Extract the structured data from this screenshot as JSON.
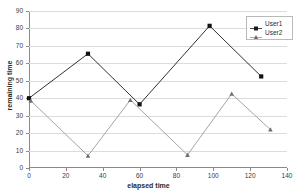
{
  "chart_data": {
    "type": "line",
    "title": "",
    "xlabel": "elapsed time",
    "ylabel": "remaining time",
    "xlim": [
      0,
      140
    ],
    "ylim": [
      0,
      90
    ],
    "xticks": [
      0,
      20,
      40,
      60,
      80,
      100,
      120,
      140
    ],
    "yticks": [
      0,
      10,
      20,
      30,
      40,
      50,
      60,
      70,
      80,
      90
    ],
    "grid": "horizontal",
    "legend_position": "top-right",
    "series": [
      {
        "name": "User1",
        "color": "#1a1a1a",
        "marker": "square",
        "x": [
          0,
          32,
          60,
          98,
          126
        ],
        "y": [
          40,
          65.5,
          36.5,
          81.5,
          52.5
        ],
        "points": [
          {
            "x": 0,
            "y": 40
          },
          {
            "x": 32,
            "y": 65.5
          },
          {
            "x": 60,
            "y": 36.5
          },
          {
            "x": 98,
            "y": 81.5
          },
          {
            "x": 126,
            "y": 52.5
          }
        ]
      },
      {
        "name": "User2",
        "color": "#9a9a9a",
        "marker": "triangle",
        "x": [
          1,
          32,
          55,
          86,
          110,
          131
        ],
        "y": [
          38.5,
          7,
          39,
          7.5,
          42.5,
          22
        ],
        "points": [
          {
            "x": 1,
            "y": 38.5
          },
          {
            "x": 32,
            "y": 7
          },
          {
            "x": 55,
            "y": 39
          },
          {
            "x": 86,
            "y": 7.5
          },
          {
            "x": 110,
            "y": 42.5
          },
          {
            "x": 131,
            "y": 22
          }
        ]
      }
    ]
  },
  "axes": {
    "x_title": "elapsed time",
    "y_title": "remaining time",
    "x_tick_labels": [
      "0",
      "20",
      "40",
      "60",
      "80",
      "100",
      "120",
      "140"
    ],
    "y_tick_labels": [
      "0",
      "10",
      "20",
      "30",
      "40",
      "50",
      "60",
      "70",
      "80",
      "90"
    ]
  },
  "legend": {
    "entries": [
      {
        "label": "User1"
      },
      {
        "label": "User2"
      }
    ]
  },
  "colors": {
    "series1": "#1a1a1a",
    "series2": "#9a9a9a",
    "grid": "#dcdcdc",
    "axis": "#8a8a8a",
    "background": "#ffffff"
  }
}
